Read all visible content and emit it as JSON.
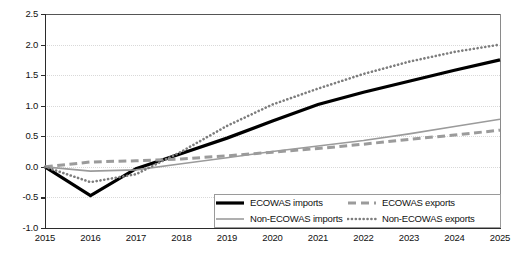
{
  "chart_data": {
    "type": "line",
    "title": "",
    "xlabel": "",
    "ylabel": "",
    "x": [
      2015,
      2016,
      2017,
      2018,
      2019,
      2020,
      2021,
      2022,
      2023,
      2024,
      2025
    ],
    "categories": [
      "2015",
      "2016",
      "2017",
      "2018",
      "2019",
      "2020",
      "2021",
      "2022",
      "2023",
      "2024",
      "2025"
    ],
    "xlim": [
      2015,
      2025
    ],
    "ylim": [
      -1.0,
      2.5
    ],
    "yticks": [
      -1.0,
      -0.5,
      0.0,
      0.5,
      1.0,
      1.5,
      2.0,
      2.5
    ],
    "ytick_labels": [
      "-1.0",
      "-0.5",
      "0.0",
      "0.5",
      "1.0",
      "1.5",
      "2.0",
      "2.5"
    ],
    "grid": true,
    "grid_style": "dotted",
    "legend_position": "bottom-right-inside",
    "series": [
      {
        "name": "ECOWAS imports",
        "style": "solid",
        "color": "#000000",
        "width": 3.2,
        "values": [
          0.0,
          -0.47,
          -0.03,
          0.22,
          0.47,
          0.75,
          1.02,
          1.22,
          1.4,
          1.58,
          1.75
        ]
      },
      {
        "name": "ECOWAS exports",
        "style": "dashed",
        "color": "#9b9b9b",
        "width": 3.0,
        "values": [
          0.0,
          0.08,
          0.1,
          0.13,
          0.18,
          0.24,
          0.3,
          0.37,
          0.45,
          0.52,
          0.6
        ]
      },
      {
        "name": "Non-ECOWAS imports",
        "style": "solid",
        "color": "#9b9b9b",
        "width": 1.6,
        "values": [
          0.0,
          -0.07,
          -0.05,
          0.05,
          0.15,
          0.25,
          0.34,
          0.43,
          0.54,
          0.66,
          0.78
        ]
      },
      {
        "name": "Non-ECOWAS exports",
        "style": "dotted",
        "color": "#7d7d7d",
        "width": 2.6,
        "values": [
          0.0,
          -0.25,
          -0.12,
          0.25,
          0.67,
          1.02,
          1.28,
          1.52,
          1.72,
          1.88,
          2.0
        ]
      }
    ]
  },
  "legend": {
    "entries": [
      {
        "label": "ECOWAS imports",
        "swatch": "solid-black-thick"
      },
      {
        "label": "ECOWAS exports",
        "swatch": "dashed-gray"
      },
      {
        "label": "Non-ECOWAS imports",
        "swatch": "solid-gray-thin"
      },
      {
        "label": "Non-ECOWAS exports",
        "swatch": "dotted-gray"
      }
    ]
  },
  "colors": {
    "ecowas_imports": "#000000",
    "ecowas_exports": "#9b9b9b",
    "non_ecowas_imports": "#9b9b9b",
    "non_ecowas_exports": "#7d7d7d",
    "axis": "#2b2b2b",
    "grid": "#d9d9d9"
  }
}
